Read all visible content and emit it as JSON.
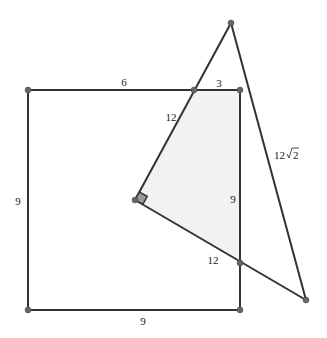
{
  "figure": {
    "shade_color": "#f2f2f2",
    "line_color": "#333333",
    "vertex_color": "#666666",
    "right_angle_marker_color": "#999999",
    "labels": {
      "square_top_left_segment": "6",
      "square_top_right_segment": "3",
      "square_left_side": "9",
      "square_bottom_side": "9",
      "overlap_right_side": "9",
      "triangle_upper_leg": "12",
      "triangle_lower_leg": "12",
      "triangle_hypotenuse": "12√2",
      "hyp_prefix": "12",
      "hyp_radicand": "2"
    }
  }
}
